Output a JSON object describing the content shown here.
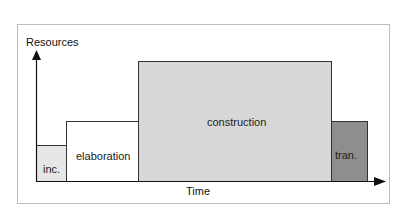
{
  "diagram": {
    "y_axis_label": "Resources",
    "x_axis_label": "Time",
    "phases": [
      {
        "name": "inc.",
        "color": "#e6e6e6"
      },
      {
        "name": "elaboration",
        "color": "#ffffff"
      },
      {
        "name": "construction",
        "color": "#d8d8d8"
      },
      {
        "name": "tran.",
        "color": "#8e8e8e"
      }
    ]
  }
}
